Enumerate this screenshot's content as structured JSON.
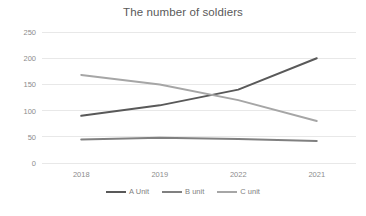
{
  "chart_data": {
    "type": "line",
    "title": "The number of soldiers",
    "xlabel": "",
    "ylabel": "",
    "categories": [
      "2018",
      "2019",
      "2022",
      "2021"
    ],
    "series": [
      {
        "name": "A Unit",
        "values": [
          90,
          110,
          140,
          200
        ],
        "color": "#595959"
      },
      {
        "name": "B unit",
        "values": [
          45,
          48,
          46,
          42
        ],
        "color": "#808080"
      },
      {
        "name": "C unit",
        "values": [
          168,
          150,
          120,
          80
        ],
        "color": "#a6a6a6"
      }
    ],
    "ylim": [
      0,
      250
    ],
    "yticks": [
      0,
      50,
      100,
      150,
      200,
      250
    ],
    "ytick_labels": [
      "0",
      "50",
      "100",
      "150",
      "200",
      "250"
    ],
    "grid": true,
    "grid_color": "#e8e8e8",
    "legend_position": "bottom",
    "background": "#ffffff",
    "title_color": "#595959",
    "tick_label_color": "#8c8c8c"
  }
}
